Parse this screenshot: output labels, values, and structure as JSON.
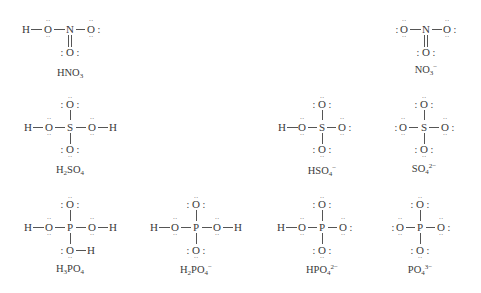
{
  "diagram": {
    "molecules": [
      {
        "id": "HNO3",
        "label": {
          "base": "HNO",
          "sub": "3",
          "sup": ""
        },
        "center": "N",
        "atoms": [
          "H",
          "O",
          "N",
          "O",
          "O"
        ]
      },
      {
        "id": "NO3-",
        "label": {
          "base": "NO",
          "sub": "3",
          "sup": "−"
        },
        "center": "N",
        "atoms": [
          "O",
          "N",
          "O",
          "O"
        ]
      },
      {
        "id": "H2SO4",
        "label": {
          "pre": "H",
          "presub": "2",
          "base": "SO",
          "sub": "4",
          "sup": ""
        },
        "center": "S",
        "atoms": [
          "H",
          "O",
          "S",
          "O",
          "H",
          "O",
          "O"
        ]
      },
      {
        "id": "HSO4-",
        "label": {
          "base": "HSO",
          "sub": "4",
          "sup": "−"
        },
        "center": "S",
        "atoms": [
          "H",
          "O",
          "S",
          "O",
          "O",
          "O"
        ]
      },
      {
        "id": "SO4_2-",
        "label": {
          "base": "SO",
          "sub": "4",
          "sup": "2−"
        },
        "center": "S",
        "atoms": [
          "O",
          "S",
          "O",
          "O",
          "O"
        ]
      },
      {
        "id": "H3PO4",
        "label": {
          "pre": "H",
          "presub": "3",
          "base": "PO",
          "sub": "4",
          "sup": ""
        },
        "center": "P",
        "atoms": [
          "H",
          "O",
          "P",
          "O",
          "H",
          "O",
          "O",
          "H"
        ]
      },
      {
        "id": "H2PO4-",
        "label": {
          "pre": "H",
          "presub": "2",
          "base": "PO",
          "sub": "4",
          "sup": "−"
        },
        "center": "P",
        "atoms": [
          "H",
          "O",
          "P",
          "O",
          "H",
          "O",
          "O"
        ]
      },
      {
        "id": "HPO4_2-",
        "label": {
          "base": "HPO",
          "sub": "4",
          "sup": "2−"
        },
        "center": "P",
        "atoms": [
          "H",
          "O",
          "P",
          "O",
          "O",
          "O"
        ]
      },
      {
        "id": "PO4_3-",
        "label": {
          "base": "PO",
          "sub": "4",
          "sup": "3−"
        },
        "center": "P",
        "atoms": [
          "O",
          "P",
          "O",
          "O",
          "O"
        ]
      }
    ],
    "symbols": {
      "H": "H",
      "O": "O",
      "N": "N",
      "S": "S",
      "P": "P",
      "lone_pair_dots": "··",
      "colon": ":"
    }
  }
}
